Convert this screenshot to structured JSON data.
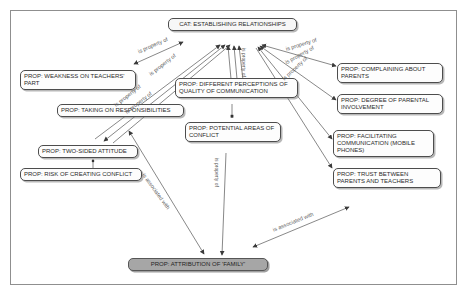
{
  "figure": {
    "nodes": {
      "cat": "CAT: ESTABLISHING RELATIONSHIPS",
      "weakness": "PROP: WEAKNESS ON TEACHERS' PART",
      "taking": "PROP: TAKING ON RESPONSIBILITIES",
      "diffperc": "PROP: DIFFERENT PERCEPTIONS OF QUALITY OF COMMUNICATION",
      "potential": "PROP: POTENTIAL AREAS OF CONFLICT",
      "twosided": "PROP: TWO-SIDED ATTITUDE",
      "risk": "PROP: RISK OF CREATING CONFLICT",
      "complaining": "PROP: COMPLAINING ABOUT PARENTS",
      "degree": "PROP: DEGREE OF PARENTAL INVOLVEMENT",
      "facilitating": "PROP: FACILITATING COMMUNICATION (MOBILE PHONES)",
      "trust": "PROP: TRUST BETWEEN PARENTS AND TEACHERS",
      "attribution": "PROP: ATTRIBUTION OF 'FAMILY'"
    },
    "edge_labels": {
      "property": "is property of",
      "associated": "is associated with"
    },
    "edges": [
      {
        "from": "weakness",
        "to": "cat",
        "label": "is property of"
      },
      {
        "from": "twosided",
        "to": "cat",
        "label": "is property of"
      },
      {
        "from": "taking",
        "to": "cat",
        "label": "is property of"
      },
      {
        "from": "diffperc",
        "to": "cat",
        "label": "is property of"
      },
      {
        "from": "complaining",
        "to": "cat",
        "label": "is property of"
      },
      {
        "from": "degree",
        "to": "cat",
        "label": "is property of"
      },
      {
        "from": "facilitating",
        "to": "cat",
        "label": "is property of"
      },
      {
        "from": "trust",
        "to": "cat",
        "label": "is property of"
      },
      {
        "from": "potential",
        "to": "attribution",
        "label": "is property of"
      },
      {
        "from": "taking",
        "to": "attribution",
        "label": "is associated with"
      },
      {
        "from": "trust",
        "to": "attribution",
        "label": "is associated with"
      },
      {
        "from": "diffperc",
        "to": "potential",
        "label": ""
      },
      {
        "from": "twosided",
        "to": "risk",
        "label": ""
      }
    ]
  }
}
